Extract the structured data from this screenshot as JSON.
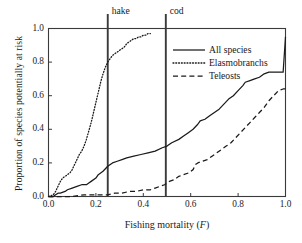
{
  "chart_data": {
    "type": "line",
    "title": "",
    "xlabel": "Fishing mortality (F)",
    "xlabel_main": "Fishing mortality (",
    "xlabel_italic": "F",
    "xlabel_close": ")",
    "ylabel": "Proportion of species potentially at risk",
    "xlim": [
      0.0,
      1.0
    ],
    "ylim": [
      0.0,
      1.0
    ],
    "grid": false,
    "legend_position": "upper right",
    "xticks": [
      "0.0",
      "0.2",
      "0.4",
      "0.6",
      "0.8",
      "1.0"
    ],
    "xtick_values": [
      0.0,
      0.2,
      0.4,
      0.6,
      0.8,
      1.0
    ],
    "yticks": [
      "0.0",
      "0.2",
      "0.4",
      "0.6",
      "0.8",
      "1.0"
    ],
    "ytick_values": [
      0.0,
      0.2,
      0.4,
      0.6,
      0.8,
      1.0
    ],
    "annotations": [
      {
        "label": "hake",
        "x": 0.25,
        "type": "vertical-line"
      },
      {
        "label": "cod",
        "x": 0.495,
        "type": "vertical-line"
      }
    ],
    "series": [
      {
        "name": "All species",
        "style": "solid",
        "color": "#1a1a1a",
        "x": [
          0.0,
          0.02,
          0.03,
          0.04,
          0.05,
          0.07,
          0.08,
          0.1,
          0.12,
          0.14,
          0.16,
          0.17,
          0.18,
          0.2,
          0.21,
          0.23,
          0.25,
          0.27,
          0.29,
          0.31,
          0.33,
          0.36,
          0.39,
          0.42,
          0.45,
          0.48,
          0.5,
          0.52,
          0.55,
          0.57,
          0.59,
          0.61,
          0.63,
          0.64,
          0.66,
          0.68,
          0.7,
          0.72,
          0.74,
          0.76,
          0.78,
          0.8,
          0.82,
          0.83,
          0.85,
          0.87,
          0.89,
          0.91,
          0.93,
          0.95,
          0.97,
          0.99,
          1.0
        ],
        "y": [
          0.0,
          0.0,
          0.01,
          0.02,
          0.02,
          0.03,
          0.04,
          0.05,
          0.06,
          0.07,
          0.07,
          0.08,
          0.09,
          0.11,
          0.13,
          0.15,
          0.18,
          0.2,
          0.21,
          0.22,
          0.23,
          0.24,
          0.25,
          0.26,
          0.27,
          0.29,
          0.3,
          0.32,
          0.34,
          0.36,
          0.38,
          0.4,
          0.43,
          0.45,
          0.46,
          0.48,
          0.5,
          0.52,
          0.55,
          0.58,
          0.6,
          0.63,
          0.66,
          0.68,
          0.69,
          0.7,
          0.71,
          0.73,
          0.74,
          0.74,
          0.74,
          0.74,
          0.95
        ]
      },
      {
        "name": "Elasmobranchs",
        "style": "dotted",
        "color": "#1a1a1a",
        "x": [
          0.0,
          0.02,
          0.03,
          0.04,
          0.05,
          0.06,
          0.07,
          0.08,
          0.09,
          0.1,
          0.11,
          0.12,
          0.13,
          0.14,
          0.15,
          0.16,
          0.17,
          0.18,
          0.19,
          0.2,
          0.21,
          0.22,
          0.23,
          0.24,
          0.25,
          0.26,
          0.27,
          0.28,
          0.29,
          0.3,
          0.31,
          0.32,
          0.33,
          0.34,
          0.35,
          0.36,
          0.37,
          0.38,
          0.39,
          0.4,
          0.41,
          0.42,
          0.43
        ],
        "y": [
          0.0,
          0.01,
          0.03,
          0.06,
          0.09,
          0.11,
          0.12,
          0.13,
          0.14,
          0.16,
          0.19,
          0.22,
          0.25,
          0.27,
          0.3,
          0.34,
          0.39,
          0.44,
          0.5,
          0.56,
          0.62,
          0.68,
          0.73,
          0.77,
          0.8,
          0.82,
          0.84,
          0.85,
          0.86,
          0.87,
          0.88,
          0.89,
          0.91,
          0.92,
          0.93,
          0.94,
          0.94,
          0.95,
          0.95,
          0.96,
          0.96,
          0.97,
          0.97
        ]
      },
      {
        "name": "Teleosts",
        "style": "dashed",
        "color": "#1a1a1a",
        "x": [
          0.0,
          0.05,
          0.1,
          0.15,
          0.2,
          0.25,
          0.28,
          0.31,
          0.34,
          0.37,
          0.4,
          0.43,
          0.45,
          0.47,
          0.49,
          0.51,
          0.53,
          0.55,
          0.57,
          0.59,
          0.61,
          0.62,
          0.63,
          0.65,
          0.67,
          0.69,
          0.71,
          0.73,
          0.75,
          0.77,
          0.79,
          0.81,
          0.83,
          0.85,
          0.87,
          0.89,
          0.91,
          0.93,
          0.95,
          0.97,
          0.99,
          1.0
        ],
        "y": [
          0.0,
          0.0,
          0.0,
          0.01,
          0.01,
          0.01,
          0.02,
          0.02,
          0.03,
          0.03,
          0.04,
          0.04,
          0.05,
          0.06,
          0.07,
          0.09,
          0.1,
          0.12,
          0.13,
          0.14,
          0.16,
          0.19,
          0.2,
          0.21,
          0.22,
          0.24,
          0.26,
          0.28,
          0.3,
          0.32,
          0.35,
          0.38,
          0.41,
          0.44,
          0.47,
          0.5,
          0.53,
          0.57,
          0.6,
          0.63,
          0.64,
          0.64
        ]
      }
    ]
  },
  "legend": {
    "items": [
      {
        "label": "All species",
        "style": "solid"
      },
      {
        "label": "Elasmobranchs",
        "style": "dotted"
      },
      {
        "label": "Teleosts",
        "style": "dashed"
      }
    ]
  },
  "colors": {
    "axis": "#3a3a3a",
    "line": "#1a1a1a",
    "vline": "#3a3a3a",
    "background": "#ffffff"
  }
}
